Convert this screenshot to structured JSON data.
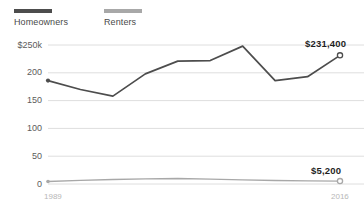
{
  "legend": {
    "items": [
      {
        "label": "Homeowners",
        "color": "#4d4d4d"
      },
      {
        "label": "Renters",
        "color": "#a8a8a8"
      }
    ]
  },
  "axis": {
    "y_ticks": [
      "$250k",
      "200",
      "150",
      "100",
      "50",
      "0"
    ],
    "x_ticks": [
      "1989",
      "2016"
    ]
  },
  "annotations": {
    "homeowners_end": "$231,400",
    "renters_end": "$5,200"
  },
  "chart_data": {
    "type": "line",
    "title": "",
    "subtitle": "",
    "xlabel": "",
    "ylabel": "",
    "ylim": [
      0,
      250
    ],
    "xlim": [
      1989,
      2016
    ],
    "grid": true,
    "legend_position": "top-left",
    "ytick_values": [
      250,
      200,
      150,
      100,
      50,
      0
    ],
    "ytick_labels": [
      "$250k",
      "200",
      "150",
      "100",
      "50",
      "0"
    ],
    "x": [
      1989,
      1992,
      1995,
      1998,
      2001,
      2004,
      2007,
      2010,
      2013,
      2016
    ],
    "xtick_labels": [
      "1989",
      "2016"
    ],
    "series": [
      {
        "name": "Homeowners",
        "color": "#4d4d4d",
        "values": [
          186,
          170,
          158,
          198,
          221,
          222,
          248,
          186,
          193,
          231.4
        ],
        "end_label": "$231,400",
        "start_marker": "filled-dot",
        "end_marker": "open-circle"
      },
      {
        "name": "Renters",
        "color": "#a8a8a8",
        "values": [
          4.6,
          6.5,
          8.0,
          9.2,
          9.8,
          8.8,
          7.5,
          6.2,
          5.6,
          5.2
        ],
        "end_label": "$5,200",
        "start_marker": "filled-dot",
        "end_marker": "open-circle"
      }
    ]
  }
}
